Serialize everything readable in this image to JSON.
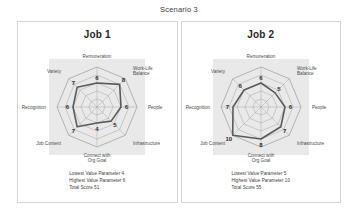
{
  "title": "Scenario 3",
  "panels": [
    {
      "title": "Job 1",
      "caption": {
        "lowest": "Lowest Value Parameter 4",
        "highest": "Highest Value Parameter 6",
        "total": "Total Score 51"
      }
    },
    {
      "title": "Job 2",
      "caption": {
        "lowest": "Lowest Value Parameter 5",
        "highest": "Highest Value Parameter 10",
        "total": "Total Score 55"
      }
    }
  ],
  "colors": {
    "plot_background": "#e2e2e2",
    "grid_line": "#9a9a9a",
    "series_line": "#5a5a5a",
    "panel_border": "#d4d4d4",
    "text": "#3b3b3b"
  },
  "chart_data": [
    {
      "type": "radar",
      "title": "Job 1",
      "categories": [
        "Remuneration",
        "Work-Life Balance",
        "People",
        "Infrastructure",
        "Connect with Org Goal",
        "Job Content",
        "Recognition",
        "Variety"
      ],
      "values": [
        6,
        8,
        6,
        5,
        4,
        7,
        6,
        7
      ],
      "rlim": [
        0,
        10
      ],
      "rings": 5,
      "grid": true,
      "legend": "none",
      "xlabel": "",
      "ylabel": ""
    },
    {
      "type": "radar",
      "title": "Job 2",
      "categories": [
        "Remuneration",
        "Work-Life Balance",
        "People",
        "Infrastructure",
        "Connect with Org Goal",
        "Job Content",
        "Recognition",
        "Variety"
      ],
      "values": [
        6,
        5,
        6,
        7,
        8,
        10,
        7,
        6
      ],
      "rlim": [
        0,
        10
      ],
      "rings": 5,
      "grid": true,
      "legend": "none",
      "xlabel": "",
      "ylabel": ""
    }
  ]
}
